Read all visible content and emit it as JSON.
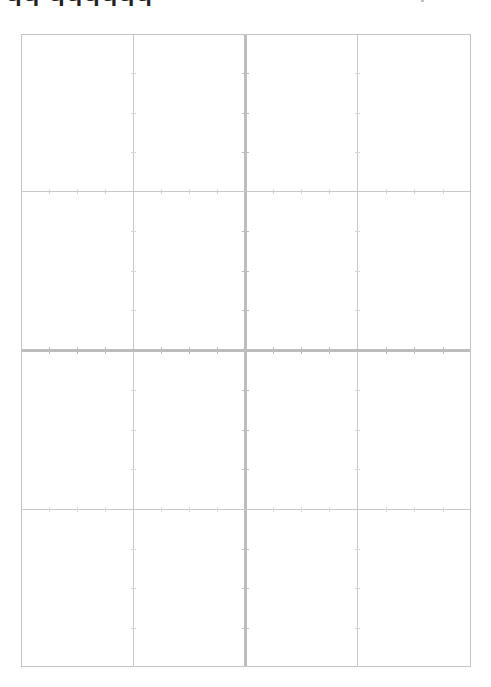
{
  "page": {
    "type": "blank grid sheet",
    "header_clipped_text_left": "ЧЧ ЧЧЧЧЧЧ",
    "header_clipped_text_right": "Ч"
  },
  "grid": {
    "columns": 4,
    "rows": 4,
    "line_color": "#c8c8c8",
    "major_line_color": "#bdbdbd",
    "background": "#ffffff",
    "bounds": {
      "left": 21,
      "top": 34,
      "right": 471,
      "bottom": 667
    },
    "vertical_lines_x": [
      133,
      245,
      357
    ],
    "horizontal_lines_y": [
      191,
      350,
      509
    ],
    "major_axes": {
      "vertical_x": 245,
      "horizontal_y": 350
    },
    "ticks_per_cell_segment": 3
  }
}
